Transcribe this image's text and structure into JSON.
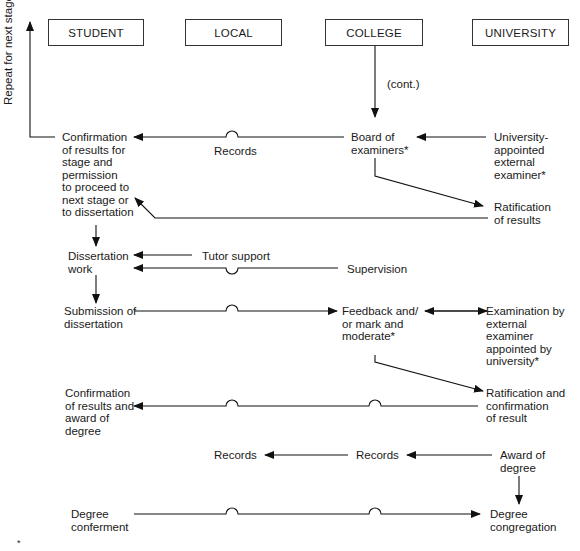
{
  "columns": [
    {
      "id": "student",
      "label": "STUDENT"
    },
    {
      "id": "local",
      "label": "LOCAL"
    },
    {
      "id": "college",
      "label": "COLLEGE"
    },
    {
      "id": "university",
      "label": "UNIVERSITY"
    }
  ],
  "side_label": "Repeat for next stage",
  "cont_label": "(cont.)",
  "nodes": {
    "confirmation_stage": "Confirmation\nof results for\nstage and\npermission\nto proceed to\nnext stage or\nto dissertation",
    "board_of_examiners": "Board of\nexaminers*",
    "university_external_examiner": "University-\nappointed\nexternal\nexaminer*",
    "ratification_results": "Ratification\nof results",
    "dissertation_work": "Dissertation\nwork",
    "submission_dissertation": "Submission of\ndissertation",
    "feedback_mark": "Feedback and/\nor mark and\nmoderate*",
    "examination_external": "Examination by\nexternal\nexaminer\nappointed by\nuniversity*",
    "ratification_confirmation": "Ratification and\nconfirmation\nof result",
    "confirmation_award": "Confirmation\nof results and\naward of\ndegree",
    "award_of_degree": "Award of\ndegree",
    "degree_conferment": "Degree\nconferment",
    "degree_congregation": "Degree\ncongregation"
  },
  "edge_labels": {
    "records_1": "Records",
    "tutor_support": "Tutor support",
    "supervision": "Supervision",
    "records_local": "Records",
    "records_college": "Records"
  },
  "footnote": "*"
}
